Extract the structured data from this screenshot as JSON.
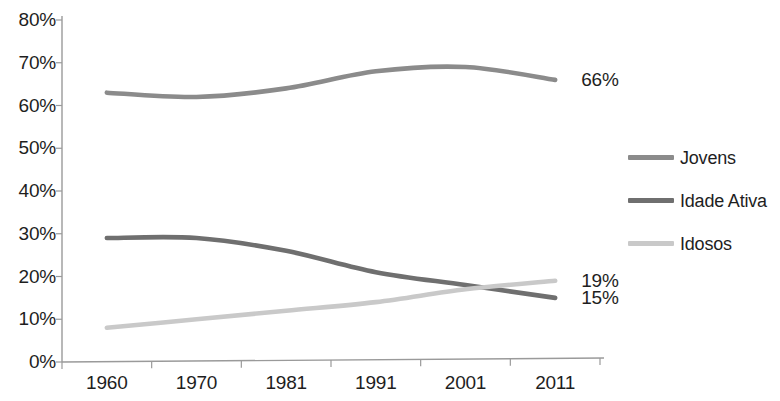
{
  "chart_data": {
    "type": "line",
    "title": "",
    "subtitle": "",
    "xlabel": "",
    "ylabel": "",
    "categories": [
      "1960",
      "1970",
      "1981",
      "1991",
      "2001",
      "2011"
    ],
    "ylim": [
      0,
      80
    ],
    "y_ticks": [
      "0%",
      "10%",
      "20%",
      "30%",
      "40%",
      "50%",
      "60%",
      "70%",
      "80%"
    ],
    "y_tick_values": [
      0,
      10,
      20,
      30,
      40,
      50,
      60,
      70,
      80
    ],
    "grid": false,
    "legend_position": "right",
    "series": [
      {
        "name": "Jovens",
        "color": "#8b8b8b",
        "values": [
          63,
          62,
          64,
          68,
          69,
          66
        ],
        "end_label": "66%"
      },
      {
        "name": "Idade Ativa",
        "color": "#6f6f6f",
        "values": [
          29,
          29,
          26,
          21,
          18,
          15
        ],
        "end_label": "15%"
      },
      {
        "name": "Idosos",
        "color": "#c9c9c9",
        "values": [
          8,
          10,
          12,
          14,
          17,
          19
        ],
        "end_label": "19%"
      }
    ],
    "annotations": [
      {
        "text": "66%",
        "series": "Jovens",
        "value": 66
      },
      {
        "text": "19%",
        "series": "Idosos",
        "value": 19
      },
      {
        "text": "15%",
        "series": "Idade Ativa",
        "value": 15
      }
    ],
    "axis_color": "#9a9a9a"
  }
}
